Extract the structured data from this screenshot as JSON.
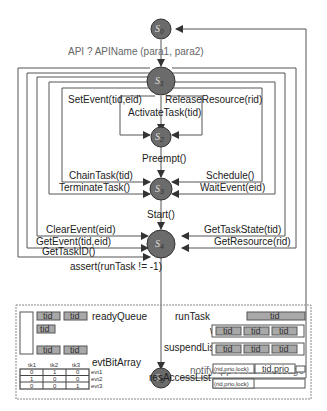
{
  "diagram": {
    "states": [
      {
        "id": "s0",
        "label": "S",
        "sub": "0"
      },
      {
        "id": "s1",
        "label": "S",
        "sub": "1"
      },
      {
        "id": "s2",
        "label": "S",
        "sub": "2"
      },
      {
        "id": "s3",
        "label": "S",
        "sub": "3"
      },
      {
        "id": "s4",
        "label": "S",
        "sub": "4"
      },
      {
        "id": "s5",
        "label": "S",
        "sub": "5"
      }
    ],
    "transitions": {
      "s0_s1": "API ? APIName (para1, para2)",
      "set_event": "SetEvent(tid,eid)",
      "release_resource": "ReleaseResource(rid)",
      "activate_task": "ActivateTask(tid)",
      "preempt": "Preempt()",
      "chain_task": "ChainTask(tid)",
      "schedule": "Schedule()",
      "terminate_task": "TerminateTask()",
      "wait_event": "WaitEvent(eid)",
      "start": "Start()",
      "clear_event": "ClearEvent(eid)",
      "get_task_state": "GetTaskState(tid)",
      "get_event": "GetEvent(tid,eid)",
      "get_resource": "GetResource(rid)",
      "get_task_id": "GetTaskID()",
      "assert": "assert(runTask != -1)",
      "notify": "notifyApp ! finishMessage"
    }
  },
  "data_structures": {
    "ready_queue": {
      "label": "readyQueue",
      "cells": [
        "tid",
        "tid",
        "tid",
        "tid",
        "tid"
      ]
    },
    "evt_bit_array": {
      "label": "evtBitArray",
      "columns": [
        "tk1",
        "tk2",
        "tk3"
      ],
      "rows": [
        {
          "label": "evt1",
          "values": [
            "0",
            "1",
            "0"
          ]
        },
        {
          "label": "evt2",
          "values": [
            "1",
            "0",
            "0"
          ]
        },
        {
          "label": "evt3",
          "values": [
            "0",
            "0",
            "1"
          ]
        }
      ]
    },
    "run_task": {
      "label": "runTask",
      "cell": "tid"
    },
    "wait_list": {
      "label": "waitList",
      "cells": [
        "tid",
        "tid",
        "tid"
      ]
    },
    "suspend_list": {
      "label": "suspendList",
      "cells": [
        "tid",
        "tid",
        "tid"
      ]
    },
    "res_access_list": {
      "label": "resAccessList",
      "row1_key": "(rid,prio,lock)",
      "row1_value": "tid,prio",
      "row2_key": "(rid,prio,lock)"
    }
  }
}
